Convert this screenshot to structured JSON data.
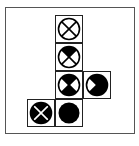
{
  "diagram": {
    "colors": {
      "fill": "#000000",
      "background": "#ffffff",
      "frame": "#555555"
    },
    "cells": [
      {
        "row": 0,
        "col": 1,
        "quadrants": {
          "top": 0,
          "right": 0,
          "bottom": 0,
          "left": 0
        },
        "cross": true,
        "solid": false
      },
      {
        "row": 1,
        "col": 1,
        "quadrants": {
          "top": 1,
          "right": 0,
          "bottom": 0,
          "left": 0
        },
        "cross": true,
        "solid": false
      },
      {
        "row": 2,
        "col": 1,
        "quadrants": {
          "top": 1,
          "right": 0,
          "bottom": 1,
          "left": 0
        },
        "cross": true,
        "solid": false
      },
      {
        "row": 2,
        "col": 2,
        "quadrants": {
          "top": 1,
          "right": 1,
          "bottom": 1,
          "left": 0
        },
        "cross": true,
        "solid": false
      },
      {
        "row": 3,
        "col": 0,
        "quadrants": {
          "top": 1,
          "right": 1,
          "bottom": 1,
          "left": 1
        },
        "cross": true,
        "solid": false
      },
      {
        "row": 3,
        "col": 1,
        "quadrants": {
          "top": 1,
          "right": 1,
          "bottom": 1,
          "left": 1
        },
        "cross": false,
        "solid": true
      }
    ]
  }
}
